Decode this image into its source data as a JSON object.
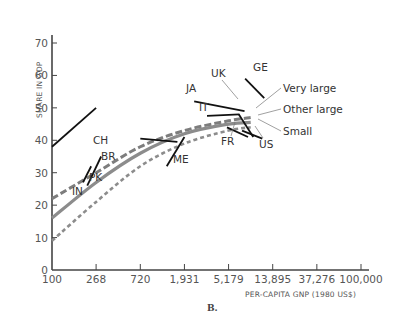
{
  "chart_data": {
    "type": "line",
    "panel_label": "B.",
    "title": "",
    "xlabel": "PER-CAPITA GNP (1980 US$)",
    "ylabel": "SHARE IN GDP",
    "x_scale": "log",
    "x_ticks": [
      "100",
      "268",
      "720",
      "1,931",
      "5,179",
      "13,895",
      "37,276",
      "100,000"
    ],
    "x_tick_values": [
      100,
      268,
      720,
      1931,
      5179,
      13895,
      37276,
      100000
    ],
    "y_ticks": [
      "0",
      "10",
      "20",
      "30",
      "40",
      "50",
      "60",
      "70"
    ],
    "y_tick_values": [
      0,
      10,
      20,
      30,
      40,
      50,
      60,
      70
    ],
    "ylim": [
      0,
      70
    ],
    "xlim": [
      100,
      100000
    ],
    "grid": false,
    "series": [
      {
        "name": "Very large",
        "style": "dashed",
        "color": "#7a7a7a",
        "x": [
          100,
          268,
          720,
          1931,
          5179,
          8500
        ],
        "y": [
          22,
          30,
          38,
          43,
          46,
          47
        ]
      },
      {
        "name": "Other large",
        "style": "solid",
        "color": "#8a8a8a",
        "x": [
          100,
          268,
          720,
          1931,
          5179,
          8500
        ],
        "y": [
          16,
          27,
          36,
          42,
          45,
          45.5
        ]
      },
      {
        "name": "Small",
        "style": "dotted-dashed",
        "color": "#8a8a8a",
        "x": [
          100,
          268,
          720,
          1931,
          5179,
          8500
        ],
        "y": [
          9,
          21,
          32,
          39,
          43,
          44
        ]
      }
    ],
    "country_segments": [
      {
        "label": "CH",
        "x0": 100,
        "y0": 38,
        "x1": 268,
        "y1": 50
      },
      {
        "label": "IN",
        "x0": 200,
        "y0": 27,
        "x1": 240,
        "y1": 32
      },
      {
        "label": "PK",
        "x0": 220,
        "y0": 26,
        "x1": 300,
        "y1": 35
      },
      {
        "label": "BR",
        "x0": 720,
        "y0": 40.5,
        "x1": 1650,
        "y1": 39.5
      },
      {
        "label": "ME",
        "x0": 1300,
        "y0": 32,
        "x1": 1931,
        "y1": 41
      },
      {
        "label": "JA",
        "x0": 2400,
        "y0": 52,
        "x1": 7400,
        "y1": 49
      },
      {
        "label": "IT",
        "x0": 3200,
        "y0": 47.5,
        "x1": 6600,
        "y1": 48
      },
      {
        "label": "UK",
        "x0": 6500,
        "y0": 48,
        "x1": 9000,
        "y1": 41
      },
      {
        "label": "FR",
        "x0": 5000,
        "y0": 44,
        "x1": 8000,
        "y1": 41
      },
      {
        "label": "US",
        "x0": 7000,
        "y0": 43,
        "x1": 11000,
        "y1": 40.5
      },
      {
        "label": "GE",
        "x0": 7500,
        "y0": 59,
        "x1": 11500,
        "y1": 53
      }
    ],
    "legend": [
      "Very large",
      "Other large",
      "Small"
    ],
    "legend_position": "right, annotated with leader lines"
  }
}
